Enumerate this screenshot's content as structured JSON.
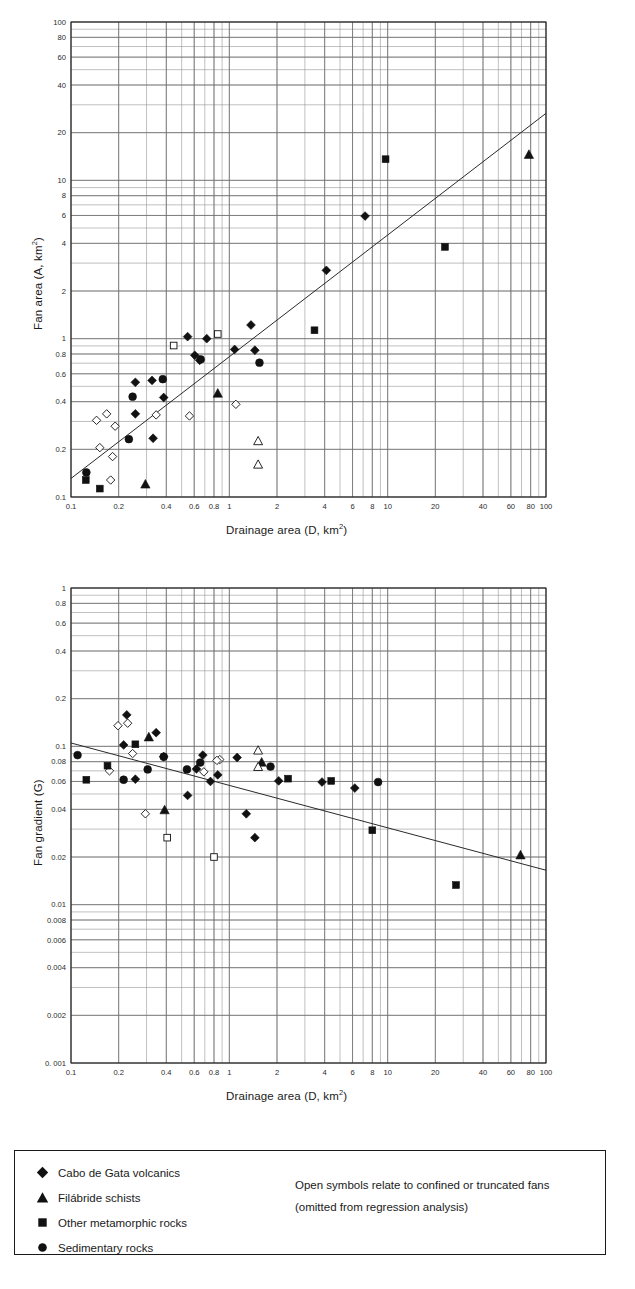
{
  "figure": {
    "background": "#ffffff",
    "accent": "#1a1a1a"
  },
  "panel_a": {
    "name": "fan-area-vs-drainage-area",
    "y_axis_title": "Fan area (A, km",
    "y_axis_title_sup": "2",
    "y_axis_title_tail": ")",
    "x_axis_title": "Drainage area (D, km",
    "x_axis_title_sup": "2",
    "x_axis_title_tail": ")"
  },
  "panel_b": {
    "name": "fan-gradient-vs-drainage-area",
    "y_axis_title": "Fan gradient (G)",
    "x_axis_title": "Drainage area (D, km",
    "x_axis_title_sup": "2",
    "x_axis_title_tail": ")"
  },
  "legend": {
    "items": [
      {
        "symbol": "filled-diamond",
        "label": "Cabo de Gata volcanics"
      },
      {
        "symbol": "filled-triangle",
        "label": "Filábride schists"
      },
      {
        "symbol": "filled-square",
        "label": "Other metamorphic rocks"
      },
      {
        "symbol": "filled-circle",
        "label": "Sedimentary rocks"
      }
    ],
    "note_line1": "Open symbols relate to confined or truncated fans",
    "note_line2": "(omitted from regression analysis)"
  },
  "chart_data": [
    {
      "type": "scatter",
      "id": "panel-a",
      "title": "",
      "xlabel": "Drainage area (D, km2)",
      "ylabel": "Fan area (A, km2)",
      "xscale": "log",
      "yscale": "log",
      "xlim": [
        0.1,
        100
      ],
      "ylim": [
        0.1,
        100
      ],
      "grid": true,
      "legend_position": "external-bottom",
      "xticks": [
        0.1,
        0.2,
        0.4,
        0.6,
        0.8,
        1,
        2,
        4,
        6,
        8,
        10,
        20,
        40,
        60,
        80,
        100
      ],
      "xticklabels": [
        "0.1",
        "0.2",
        "0.4",
        "0.6",
        "0.8",
        "1",
        "2",
        "4",
        "6",
        "8",
        "10",
        "20",
        "40",
        "60",
        "80",
        "100"
      ],
      "yticks": [
        0.1,
        0.2,
        0.4,
        0.6,
        0.8,
        1,
        2,
        4,
        6,
        8,
        10,
        20,
        40,
        60,
        80,
        100
      ],
      "yticklabels": [
        "0.1",
        "0.2",
        "0.4",
        "0.6",
        "0.8",
        "1",
        "2",
        "4",
        "6",
        "8",
        "10",
        "20",
        "40",
        "60",
        "80",
        "100"
      ],
      "regression_line": {
        "x": [
          0.1,
          100
        ],
        "y": [
          0.131,
          26.5
        ]
      },
      "series": [
        {
          "name": "Cabo de Gata volcanics",
          "marker": "diamond",
          "fill": "solid",
          "points": [
            [
              0.255,
              0.53
            ],
            [
              0.255,
              0.335
            ],
            [
              0.325,
              0.545
            ],
            [
              0.385,
              0.425
            ],
            [
              0.33,
              0.235
            ],
            [
              0.545,
              1.03
            ],
            [
              0.605,
              0.785
            ],
            [
              0.65,
              0.73
            ],
            [
              0.72,
              1.0
            ],
            [
              1.08,
              0.855
            ],
            [
              1.37,
              1.22
            ],
            [
              1.45,
              0.845
            ],
            [
              4.1,
              2.7
            ],
            [
              7.2,
              5.95
            ]
          ]
        },
        {
          "name": "Cabo de Gata volcanics (open)",
          "marker": "diamond",
          "fill": "open",
          "points": [
            [
              0.145,
              0.305
            ],
            [
              0.168,
              0.335
            ],
            [
              0.152,
              0.205
            ],
            [
              0.183,
              0.18
            ],
            [
              0.19,
              0.28
            ],
            [
              0.178,
              0.128
            ],
            [
              0.345,
              0.33
            ],
            [
              0.56,
              0.325
            ],
            [
              1.1,
              0.385
            ]
          ]
        },
        {
          "name": "Filábride schists",
          "marker": "triangle",
          "fill": "solid",
          "points": [
            [
              0.295,
              0.12
            ],
            [
              0.845,
              0.45
            ],
            [
              78,
              14.5
            ]
          ]
        },
        {
          "name": "Filábride schists (open)",
          "marker": "triangle",
          "fill": "open",
          "points": [
            [
              1.52,
              0.225
            ],
            [
              1.52,
              0.16
            ]
          ]
        },
        {
          "name": "Other metamorphic rocks",
          "marker": "square",
          "fill": "solid",
          "points": [
            [
              0.124,
              0.128
            ],
            [
              0.152,
              0.113
            ],
            [
              3.45,
              1.13
            ],
            [
              9.7,
              13.6
            ],
            [
              23,
              3.8
            ]
          ]
        },
        {
          "name": "Other metamorphic rocks (open)",
          "marker": "square",
          "fill": "open",
          "points": [
            [
              0.445,
              0.905
            ],
            [
              0.845,
              1.07
            ]
          ]
        },
        {
          "name": "Sedimentary rocks",
          "marker": "circle",
          "fill": "solid",
          "points": [
            [
              0.125,
              0.143
            ],
            [
              0.232,
              0.232
            ],
            [
              0.245,
              0.43
            ],
            [
              0.38,
              0.555
            ],
            [
              0.66,
              0.74
            ],
            [
              1.55,
              0.705
            ]
          ]
        }
      ]
    },
    {
      "type": "scatter",
      "id": "panel-b",
      "title": "",
      "xlabel": "Drainage area (D, km2)",
      "ylabel": "Fan gradient (G)",
      "xscale": "log",
      "yscale": "log",
      "xlim": [
        0.1,
        100
      ],
      "ylim": [
        0.001,
        1
      ],
      "grid": true,
      "legend_position": "external-bottom",
      "xticks": [
        0.1,
        0.2,
        0.4,
        0.6,
        0.8,
        1,
        2,
        4,
        6,
        8,
        10,
        20,
        40,
        60,
        80,
        100
      ],
      "xticklabels": [
        "0.1",
        "0.2",
        "0.4",
        "0.6",
        "0.8",
        "1",
        "2",
        "4",
        "6",
        "8",
        "10",
        "20",
        "40",
        "60",
        "80",
        "100"
      ],
      "yticks": [
        0.001,
        0.002,
        0.004,
        0.006,
        0.008,
        0.01,
        0.02,
        0.04,
        0.06,
        0.08,
        0.1,
        0.2,
        0.4,
        0.6,
        0.8,
        1
      ],
      "yticklabels": [
        "0. 001",
        "0.002",
        "0.004",
        "0.006",
        "0.008",
        "0.01",
        "0.02",
        "0.04",
        "0.06",
        "0.08",
        "0.1",
        "0.2",
        "0.4",
        "0.6",
        "0.8",
        "1"
      ],
      "regression_line": {
        "x": [
          0.1,
          100
        ],
        "y": [
          0.105,
          0.0165
        ]
      },
      "series": [
        {
          "name": "Cabo de Gata volcanics",
          "marker": "diamond",
          "fill": "solid",
          "points": [
            [
              0.225,
              0.158
            ],
            [
              0.215,
              0.102
            ],
            [
              0.255,
              0.062
            ],
            [
              0.345,
              0.122
            ],
            [
              0.385,
              0.086
            ],
            [
              0.545,
              0.049
            ],
            [
              0.62,
              0.072
            ],
            [
              0.68,
              0.088
            ],
            [
              0.76,
              0.06
            ],
            [
              0.845,
              0.066
            ],
            [
              1.12,
              0.085
            ],
            [
              1.45,
              0.0265
            ],
            [
              1.28,
              0.0375
            ],
            [
              2.05,
              0.0605
            ],
            [
              3.85,
              0.0595
            ],
            [
              6.2,
              0.0545
            ]
          ]
        },
        {
          "name": "Cabo de Gata volcanics (open)",
          "marker": "diamond",
          "fill": "open",
          "points": [
            [
              0.198,
              0.135
            ],
            [
              0.228,
              0.14
            ],
            [
              0.175,
              0.07
            ],
            [
              0.245,
              0.09
            ],
            [
              0.295,
              0.0375
            ],
            [
              0.69,
              0.069
            ],
            [
              0.87,
              0.0825
            ],
            [
              0.835,
              0.0815
            ]
          ]
        },
        {
          "name": "Filábride schists",
          "marker": "triangle",
          "fill": "solid",
          "points": [
            [
              0.31,
              0.114
            ],
            [
              0.39,
              0.0395
            ],
            [
              1.6,
              0.079
            ],
            [
              69,
              0.0205
            ]
          ]
        },
        {
          "name": "Filábride schists (open)",
          "marker": "triangle",
          "fill": "open",
          "points": [
            [
              1.52,
              0.094
            ],
            [
              1.52,
              0.074
            ]
          ]
        },
        {
          "name": "Other metamorphic rocks",
          "marker": "square",
          "fill": "solid",
          "points": [
            [
              0.125,
              0.0615
            ],
            [
              0.17,
              0.0755
            ],
            [
              0.255,
              0.103
            ],
            [
              2.35,
              0.0625
            ],
            [
              4.4,
              0.0605
            ],
            [
              8.0,
              0.0295
            ],
            [
              27,
              0.0133
            ]
          ]
        },
        {
          "name": "Other metamorphic rocks (open)",
          "marker": "square",
          "fill": "open",
          "points": [
            [
              0.405,
              0.0265
            ],
            [
              0.8,
              0.02
            ]
          ]
        },
        {
          "name": "Sedimentary rocks",
          "marker": "circle",
          "fill": "solid",
          "points": [
            [
              0.11,
              0.088
            ],
            [
              0.215,
              0.0615
            ],
            [
              0.305,
              0.0715
            ],
            [
              0.385,
              0.086
            ],
            [
              0.54,
              0.0715
            ],
            [
              0.655,
              0.079
            ],
            [
              1.82,
              0.0745
            ],
            [
              8.7,
              0.0595
            ]
          ]
        }
      ]
    }
  ]
}
